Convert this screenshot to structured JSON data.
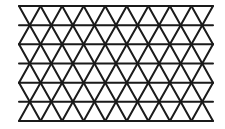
{
  "diagram": {
    "type": "triangular-lattice",
    "line_color": "#1a1a1a",
    "background": "#ffffff",
    "rows": 6,
    "columns": 9,
    "left": 19,
    "right": 213,
    "top": 6,
    "bottom": 121
  }
}
